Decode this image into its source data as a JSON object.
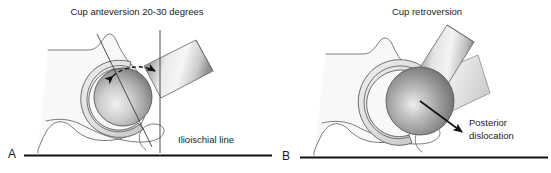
{
  "figure": {
    "background_color": "#ffffff",
    "width": 551,
    "height": 173
  },
  "panels": [
    {
      "id": "A",
      "letter": "A",
      "title": "Cup anteversion 20-30 degrees",
      "annotations": [
        {
          "id": "ilioischial-line",
          "text": "Ilioischial line"
        }
      ]
    },
    {
      "id": "B",
      "letter": "B",
      "title": "Cup retroversion",
      "annotations": [
        {
          "id": "posterior-dislocation",
          "line1": "Posterior",
          "line2": "dislocation"
        }
      ]
    }
  ],
  "colors": {
    "text": "#232323",
    "baseline": "#111111",
    "bone_fill": "#f7f7f7",
    "bone_stroke": "#6d6d6d",
    "cup_fill": "#e2e2e2",
    "cup_stroke": "#5e5e5e",
    "head_dark": "#5f5f5f",
    "head_light": "#e8e8e8",
    "stem_dark": "#5a5a5a",
    "stem_light": "#f2f2f2",
    "arrow": "#111111"
  }
}
